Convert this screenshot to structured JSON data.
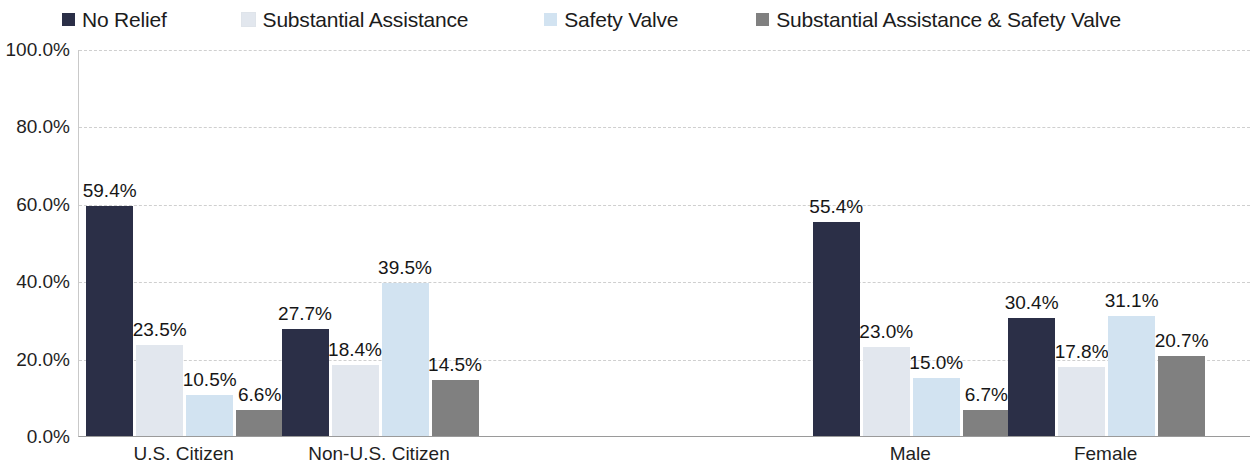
{
  "legend": {
    "items": [
      {
        "label": "No Relief",
        "color": "#2b2f47",
        "icon": "legend-swatch-icon"
      },
      {
        "label": "Substantial Assistance",
        "color": "#e2e7ee",
        "icon": "legend-swatch-icon"
      },
      {
        "label": "Safety Valve",
        "color": "#d2e3f1",
        "icon": "legend-swatch-icon"
      },
      {
        "label": "Substantial Assistance & Safety Valve",
        "color": "#808080",
        "icon": "legend-swatch-icon"
      }
    ]
  },
  "chart_data": {
    "type": "bar",
    "title": "",
    "subtitle": "",
    "xlabel": "",
    "ylabel": "",
    "ylim": [
      0,
      100
    ],
    "yticks": [
      "0.0%",
      "20.0%",
      "40.0%",
      "60.0%",
      "80.0%",
      "100.0%"
    ],
    "ytick_values": [
      0,
      20,
      40,
      60,
      80,
      100
    ],
    "grid": true,
    "legend_position": "top",
    "categories": [
      "U.S. Citizen",
      "Non-U.S. Citizen",
      "Male",
      "Female"
    ],
    "series": [
      {
        "name": "No Relief",
        "color": "#2b2f47",
        "values": [
          59.4,
          27.7,
          55.4,
          30.4
        ],
        "labels": [
          "59.4%",
          "27.7%",
          "55.4%",
          "30.4%"
        ]
      },
      {
        "name": "Substantial Assistance",
        "color": "#e2e7ee",
        "values": [
          23.5,
          18.4,
          23.0,
          17.8
        ],
        "labels": [
          "23.5%",
          "18.4%",
          "23.0%",
          "17.8%"
        ]
      },
      {
        "name": "Safety Valve",
        "color": "#d2e3f1",
        "values": [
          10.5,
          39.5,
          15.0,
          31.1
        ],
        "labels": [
          "10.5%",
          "39.5%",
          "15.0%",
          "31.1%"
        ]
      },
      {
        "name": "Substantial Assistance & Safety Valve",
        "color": "#808080",
        "values": [
          6.6,
          14.5,
          6.7,
          20.7
        ],
        "labels": [
          "6.6%",
          "14.5%",
          "6.7%",
          "20.7%"
        ]
      }
    ]
  }
}
